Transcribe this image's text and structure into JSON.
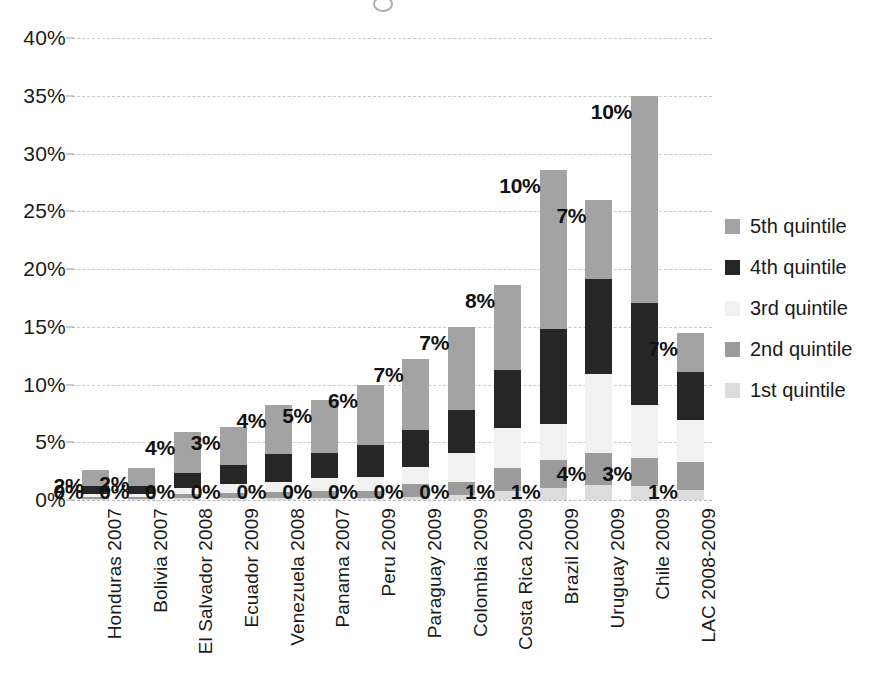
{
  "chart_data": {
    "type": "bar",
    "subtype": "stacked-vertical",
    "title": "",
    "subtitle": "",
    "xlabel": "",
    "ylabel": "",
    "ylim": [
      0,
      40
    ],
    "ytick_step": 5,
    "ytick_labels": [
      "0%",
      "5%",
      "10%",
      "15%",
      "20%",
      "25%",
      "30%",
      "35%",
      "40%"
    ],
    "ytick_values": [
      0,
      5,
      10,
      15,
      20,
      25,
      30,
      35,
      40
    ],
    "grid": true,
    "legend_position": "right",
    "value_format": "percent",
    "categories": [
      "Honduras 2007",
      "Bolivia 2007",
      "El Salvador 2008",
      "Ecuador 2009",
      "Venezuela 2008",
      "Panama 2007",
      "Peru 2009",
      "Paraguay 2009",
      "Colombia 2009",
      "Costa Rica 2009",
      "Brazil 2009",
      "Uruguay 2009",
      "Chile 2009",
      "LAC 2008-2009"
    ],
    "series": [
      {
        "name": "1st quintile",
        "color": "#dcdcdc",
        "values": [
          0.1,
          0.1,
          0.15,
          0.15,
          0.2,
          0.2,
          0.2,
          0.3,
          0.4,
          0.8,
          1.0,
          1.3,
          1.2,
          0.9
        ]
      },
      {
        "name": "2nd quintile",
        "color": "#9b9b9b",
        "values": [
          0.2,
          0.2,
          0.4,
          0.5,
          0.5,
          0.6,
          0.6,
          1.1,
          1.2,
          2.0,
          2.5,
          2.8,
          2.4,
          2.4
        ]
      },
      {
        "name": "3rd quintile",
        "color": "#f1f1f1",
        "values": [
          0.2,
          0.2,
          0.5,
          0.7,
          0.9,
          1.1,
          1.2,
          1.5,
          2.5,
          3.4,
          3.1,
          6.8,
          4.6,
          3.6
        ]
      },
      {
        "name": "4th quintile",
        "color": "#262626",
        "values": [
          0.7,
          0.7,
          1.3,
          1.7,
          2.4,
          2.2,
          2.8,
          3.2,
          3.7,
          5.1,
          8.2,
          8.2,
          8.9,
          4.2
        ]
      },
      {
        "name": "5th quintile",
        "color": "#a3a3a3",
        "values": [
          1.4,
          1.6,
          3.5,
          3.3,
          4.2,
          4.6,
          5.2,
          6.1,
          7.2,
          7.3,
          13.8,
          6.9,
          17.9,
          3.4
        ]
      }
    ],
    "totals": [
      2.6,
      2.8,
      5.85,
      6.35,
      8.2,
      8.7,
      10.0,
      12.2,
      15.0,
      18.6,
      28.6,
      26.0,
      35.0,
      14.5
    ],
    "top_value_labels": [
      "2%",
      "2%",
      "4%",
      "3%",
      "4%",
      "5%",
      "6%",
      "7%",
      "7%",
      "8%",
      "10%",
      "7%",
      "10%",
      "7%"
    ],
    "bottom_value_labels": [
      "0%",
      "0%",
      "0%",
      "0%",
      "0%",
      "0%",
      "0%",
      "0%",
      "0%",
      "1%",
      "1%",
      "4%",
      "3%",
      "1%"
    ]
  },
  "legend": {
    "items": [
      {
        "label": "5th quintile",
        "color": "#a3a3a3"
      },
      {
        "label": "4th quintile",
        "color": "#262626"
      },
      {
        "label": "3rd quintile",
        "color": "#f1f1f1"
      },
      {
        "label": "2nd quintile",
        "color": "#9b9b9b"
      },
      {
        "label": "1st quintile",
        "color": "#dcdcdc"
      }
    ]
  }
}
